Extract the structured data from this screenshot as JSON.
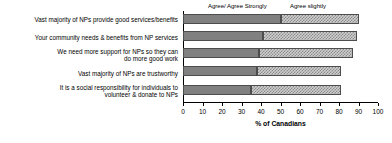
{
  "chart_data": {
    "type": "bar",
    "orientation": "horizontal",
    "stacked": true,
    "title": "",
    "subtitle": "",
    "xlabel": "% of Canadians",
    "ylabel": "",
    "xlim": [
      0,
      100
    ],
    "xticks": [
      0,
      10,
      20,
      30,
      40,
      50,
      60,
      70,
      80,
      90,
      100
    ],
    "grid": false,
    "legend_position": "top",
    "categories": [
      "Vast majority of NPs provide good services/benefits",
      "Your community needs & benefits from NP services",
      "We need more support for NPs so they can\ndo more good work",
      "Vast majority of NPs are trustworthy",
      "It is a social responsibility for individuals to\nvolunteer & donate to NPs"
    ],
    "series": [
      {
        "name": "Agree/ Agree Strongly",
        "values": [
          50,
          41,
          39,
          38,
          35
        ],
        "color": "#808080"
      },
      {
        "name": "Agree slightly",
        "values": [
          40,
          48,
          48,
          43,
          46
        ],
        "color": "#cfcfcf"
      }
    ],
    "totals": [
      90,
      89,
      87,
      81,
      81
    ]
  },
  "legend": {
    "entries": [
      {
        "label": "Agree/ Agree Strongly"
      },
      {
        "label": "Agree slightly"
      }
    ]
  }
}
